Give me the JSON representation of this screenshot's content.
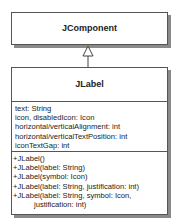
{
  "diagram": {
    "type": "uml-class-diagram",
    "classes": [
      {
        "name": "JComponent",
        "attributes": [],
        "methods": []
      },
      {
        "name": "JLabel",
        "attributes": [
          "text: String",
          "icon, disabledIcon: Icon",
          "horizontal/verticalAlignment: int",
          "horizontal/verticalTextPosition: int",
          "iconTextGap: int"
        ],
        "methods": [
          "+JLabel()",
          "+JLabel(label: String)",
          "+JLabel(symbol: Icon)",
          "+JLabel(label: String, justification: int)",
          "+JLabel(label: String, symbol: Icon,",
          "justification: int)"
        ]
      }
    ],
    "relationships": [
      {
        "type": "generalization",
        "from": "JLabel",
        "to": "JComponent"
      }
    ],
    "colors": {
      "border": "#555555",
      "shadow": "#8a8a8a",
      "background": "#ffffff"
    }
  }
}
